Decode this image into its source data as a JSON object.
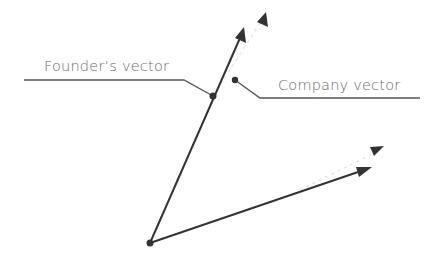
{
  "diagram": {
    "labels": {
      "founder": "Founder’s vector",
      "company": "Company vector"
    },
    "colors": {
      "line": "#333333",
      "leader": "#555555",
      "text": "#6a6a6a",
      "faint": "#e4e4e4",
      "background": "#ffffff"
    },
    "points": {
      "origin": [
        150,
        243
      ],
      "founder_tip": [
        243,
        28
      ],
      "founder_ghost_tip": [
        263,
        16
      ],
      "company_tip": [
        370,
        168
      ],
      "company_ghost_tip": [
        382,
        147
      ],
      "founder_dot": [
        213,
        96
      ],
      "company_dot": [
        235,
        80
      ]
    }
  }
}
